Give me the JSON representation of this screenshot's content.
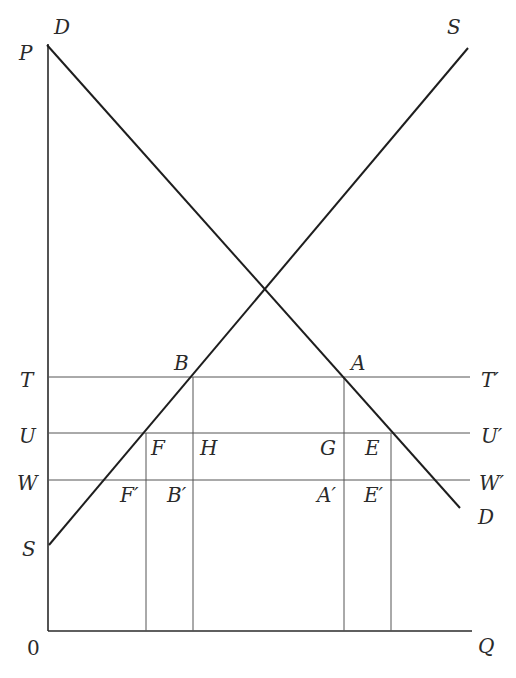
{
  "header": {
    "text": ""
  },
  "axes": {
    "origin_label": "0",
    "y_axis_label": "P",
    "x_axis_label": "Q"
  },
  "curves": {
    "demand": {
      "label_top": "D",
      "label_bottom": "D"
    },
    "supply": {
      "label_top": "S",
      "label_bottom": "S"
    }
  },
  "price_levels": {
    "T": {
      "left": "T",
      "right": "T′"
    },
    "U": {
      "left": "U",
      "right": "U′"
    },
    "W": {
      "left": "W",
      "right": "W′"
    }
  },
  "points": {
    "A": "A",
    "B": "B",
    "E": "E",
    "F": "F",
    "G": "G",
    "H": "H",
    "A_prime": "A′",
    "B_prime": "B′",
    "E_prime": "E′",
    "F_prime": "F′"
  },
  "colors": {
    "line": "#1e1e1e",
    "guide": "#555555",
    "text": "#2a2a2a",
    "background": "#ffffff"
  }
}
